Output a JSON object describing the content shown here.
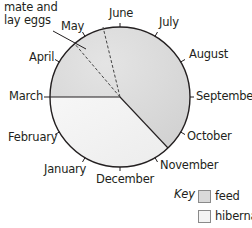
{
  "diagram": {
    "type": "circular-annual-cycle",
    "annotation": {
      "line1": "mate and",
      "line2": "lay eggs"
    },
    "months": [
      {
        "name": "June"
      },
      {
        "name": "July"
      },
      {
        "name": "August"
      },
      {
        "name": "September"
      },
      {
        "name": "October"
      },
      {
        "name": "November"
      },
      {
        "name": "December"
      },
      {
        "name": "January"
      },
      {
        "name": "February"
      },
      {
        "name": "March"
      },
      {
        "name": "April"
      },
      {
        "name": "May"
      }
    ],
    "segments": [
      {
        "activity": "feed",
        "from": "March",
        "to": "November",
        "color": "#d9d9d9"
      },
      {
        "activity": "hibernate",
        "from": "November",
        "to": "March",
        "color": "#f3f3f3"
      },
      {
        "activity": "mate and lay eggs",
        "from": "April/May",
        "to": "May/June",
        "style": "dashed"
      }
    ],
    "key": {
      "title": "Key",
      "items": [
        {
          "label": "feed",
          "color": "#d9d9d9"
        },
        {
          "label": "hibernate",
          "color": "#f3f3f3"
        }
      ]
    }
  }
}
